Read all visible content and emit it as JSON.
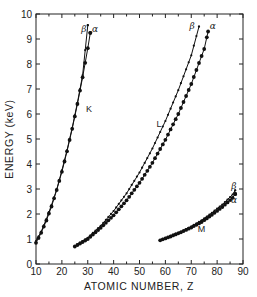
{
  "chart_data": {
    "type": "line",
    "title": "",
    "xlabel": "ATOMIC NUMBER, Z",
    "ylabel": "ENERGY (keV)",
    "xlim": [
      10,
      90
    ],
    "ylim": [
      0,
      10
    ],
    "xticks": [
      10,
      20,
      30,
      40,
      50,
      60,
      70,
      80,
      90
    ],
    "yticks": [
      0,
      1,
      2,
      3,
      4,
      5,
      6,
      7,
      8,
      9,
      10
    ],
    "grid": false,
    "legend": "none (inline labels)",
    "annotations": [
      {
        "text": "K",
        "x": 30.5,
        "y": 6.1
      },
      {
        "text": "L",
        "x": 57.5,
        "y": 5.5
      },
      {
        "text": "M",
        "x": 74,
        "y": 1.3
      },
      {
        "text": "β",
        "x": 28.5,
        "y": 9.3
      },
      {
        "text": "α",
        "x": 32.8,
        "y": 9.3
      },
      {
        "text": "β",
        "x": 70.3,
        "y": 9.4
      },
      {
        "text": "α",
        "x": 78.3,
        "y": 9.4
      },
      {
        "text": "β",
        "x": 86.5,
        "y": 3.0
      },
      {
        "text": "α",
        "x": 86.5,
        "y": 2.45
      }
    ],
    "series": [
      {
        "name": "K-beta",
        "group": "K",
        "marker": "small-dot",
        "x": [
          10,
          12,
          14,
          16,
          18,
          20,
          22,
          24,
          26,
          28,
          30
        ],
        "y": [
          0.92,
          1.3,
          1.8,
          2.36,
          2.98,
          3.75,
          4.55,
          5.45,
          6.45,
          7.55,
          9.55
        ]
      },
      {
        "name": "K-alpha",
        "group": "K",
        "marker": "large-dot",
        "x": [
          10,
          12,
          14,
          16,
          18,
          20,
          22,
          24,
          26,
          28,
          30,
          31
        ],
        "y": [
          0.85,
          1.25,
          1.74,
          2.3,
          2.96,
          3.69,
          4.51,
          5.41,
          6.4,
          7.47,
          8.63,
          9.25
        ]
      },
      {
        "name": "L-beta",
        "group": "L",
        "marker": "small-dot",
        "x": [
          25,
          30,
          35,
          40,
          45,
          50,
          55,
          60,
          65,
          70,
          73
        ],
        "y": [
          0.72,
          1.05,
          1.53,
          2.12,
          2.83,
          3.66,
          4.62,
          5.72,
          6.95,
          8.35,
          9.5
        ]
      },
      {
        "name": "L-alpha",
        "group": "L",
        "marker": "large-dot",
        "x": [
          25,
          30,
          35,
          40,
          45,
          50,
          55,
          60,
          65,
          70,
          75,
          76.5
        ],
        "y": [
          0.7,
          1.0,
          1.45,
          1.95,
          2.55,
          3.25,
          4.05,
          4.97,
          6.0,
          7.2,
          8.6,
          9.3
        ]
      },
      {
        "name": "M-beta",
        "group": "M",
        "marker": "small-dot",
        "x": [
          58,
          62,
          66,
          70,
          74,
          78,
          82,
          86,
          87
        ],
        "y": [
          0.97,
          1.13,
          1.3,
          1.5,
          1.75,
          2.05,
          2.38,
          2.78,
          2.95
        ]
      },
      {
        "name": "M-alpha",
        "group": "M",
        "marker": "large-dot",
        "x": [
          58,
          62,
          66,
          70,
          74,
          78,
          82,
          86,
          87
        ],
        "y": [
          0.95,
          1.1,
          1.27,
          1.46,
          1.68,
          1.97,
          2.28,
          2.65,
          2.8
        ]
      }
    ]
  }
}
